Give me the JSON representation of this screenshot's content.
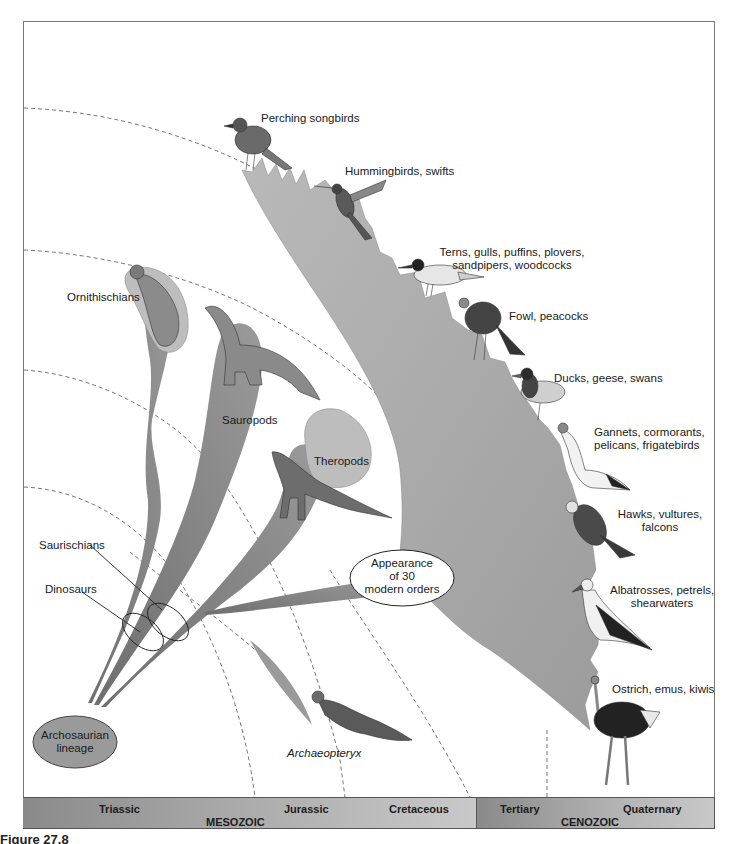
{
  "figure": {
    "caption": "Figure 27.8"
  },
  "timeline": {
    "eras": [
      {
        "name": "MESOZOIC",
        "periods": [
          "Triassic",
          "Jurassic",
          "Cretaceous"
        ]
      },
      {
        "name": "CENOZOIC",
        "periods": [
          "Tertiary",
          "Quaternary"
        ]
      }
    ]
  },
  "root": {
    "label": "Archosaurian lineage",
    "line1": "Archosaurian",
    "line2": "lineage"
  },
  "groups": {
    "saurischians": "Saurischians",
    "dinosaurs": "Dinosaurs",
    "ornithischians": "Ornithischians",
    "sauropods": "Sauropods",
    "theropods": "Theropods",
    "archaeopteryx": "Archaeopteryx"
  },
  "callout": {
    "text": "Appearance of 30 modern orders",
    "line1": "Appearance",
    "line2": "of 30",
    "line3": "modern orders"
  },
  "bird_orders": [
    {
      "line1": "Perching songbirds",
      "line2": ""
    },
    {
      "line1": "Hummingbirds, swifts",
      "line2": ""
    },
    {
      "line1": "Terns, gulls, puffins, plovers,",
      "line2": "sandpipers, woodcocks"
    },
    {
      "line1": "Fowl, peacocks",
      "line2": ""
    },
    {
      "line1": "Ducks, geese, swans",
      "line2": ""
    },
    {
      "line1": "Gannets, cormorants,",
      "line2": "pelicans, frigatebirds"
    },
    {
      "line1": "Hawks, vultures,",
      "line2": "falcons"
    },
    {
      "line1": "Albatrosses, petrels,",
      "line2": "shearwaters"
    },
    {
      "line1": "Ostrich, emus, kiwis",
      "line2": ""
    }
  ],
  "colors": {
    "clade_fill": "#a8a8a8",
    "clade_dark": "#7d7d7d",
    "band_dark": "#8a8a8a",
    "band_light": "#c9c9c9",
    "root_fill": "#999999"
  }
}
